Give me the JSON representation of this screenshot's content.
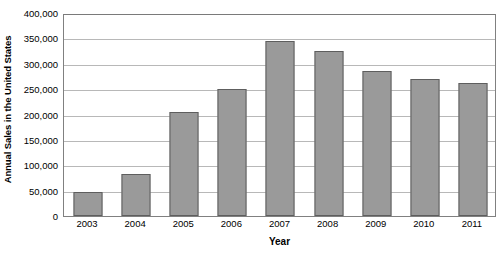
{
  "chart_data": {
    "type": "bar",
    "title": "",
    "xlabel": "Year",
    "ylabel": "Annual Sales in the United States",
    "categories": [
      "2003",
      "2004",
      "2005",
      "2006",
      "2007",
      "2008",
      "2009",
      "2010",
      "2011"
    ],
    "values": [
      48000,
      83000,
      204000,
      250000,
      345000,
      325000,
      285000,
      270000,
      263000
    ],
    "ylim": [
      0,
      400000
    ],
    "yticks": [
      0,
      50000,
      100000,
      150000,
      200000,
      250000,
      300000,
      350000,
      400000
    ],
    "ytick_labels": [
      "0",
      "50,000",
      "100,000",
      "150,000",
      "200,000",
      "250,000",
      "300,000",
      "350,000",
      "400,000"
    ],
    "grid": true,
    "legend": null,
    "series": [
      {
        "name": "Annual Sales",
        "values": [
          48000,
          83000,
          204000,
          250000,
          345000,
          325000,
          285000,
          270000,
          263000
        ]
      }
    ],
    "colors": {
      "bar_fill": "#9a9a9a",
      "bar_border": "#5e5e5e",
      "gridline": "#b8b8b8",
      "axis": "#808080",
      "text": "#000000",
      "background": "#ffffff"
    }
  }
}
